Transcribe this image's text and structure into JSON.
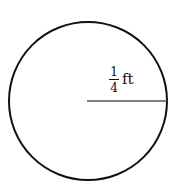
{
  "diagram": {
    "shape": "circle",
    "center": [
      88,
      101
    ],
    "radius_px": 79,
    "stroke_color": "#111111",
    "radius_line_color": "#555555",
    "label": {
      "numerator": "1",
      "denominator": "4",
      "unit": "ft"
    }
  }
}
